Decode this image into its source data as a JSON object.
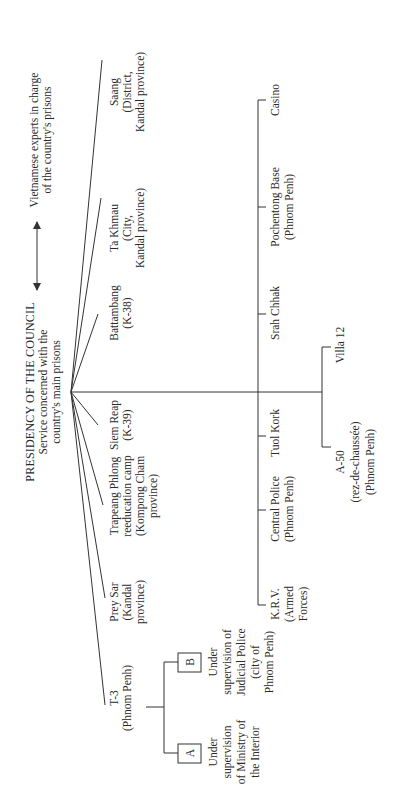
{
  "diagram": {
    "orientation": "rotated-90-counterclockwise",
    "root": {
      "title": "PRESIDENCY OF THE COUNCIL",
      "subtitle_lines": [
        "Service concerned with the",
        "country's main prisons"
      ]
    },
    "side_note": {
      "arrow": "double-headed-arrow",
      "lines": [
        "Vietnamese experts in charge",
        "of the country's prisons"
      ]
    },
    "fan_branches": [
      {
        "id": "saang",
        "lines": [
          "Saang",
          "(District,",
          "Kandal province)"
        ]
      },
      {
        "id": "ta-khmau",
        "lines": [
          "Ta Khmau",
          "(City,",
          "Kandal province)"
        ]
      },
      {
        "id": "battambang",
        "lines": [
          "Battambang",
          "(K-38)"
        ]
      },
      {
        "id": "siem-reap",
        "lines": [
          "Siem Reap",
          "(K-39)"
        ]
      },
      {
        "id": "trapeang-phlong",
        "lines": [
          "Trapeang Phlong",
          "reeducation camp",
          "(Kompong Cham",
          "province)"
        ]
      },
      {
        "id": "prey-sar",
        "lines": [
          "Prey Sar",
          "(Kandal",
          "province)"
        ]
      },
      {
        "id": "t-3",
        "lines": [
          "T-3",
          "(Phnom Penh)"
        ]
      }
    ],
    "t3_sub": [
      {
        "id": "a",
        "box_label": "A",
        "lines": [
          "Under",
          "supervision",
          "of Ministry of",
          "the Interior"
        ]
      },
      {
        "id": "b",
        "box_label": "B",
        "lines": [
          "Under",
          "supervision of",
          "Judicial Police",
          "(city of",
          "Phnom Penh)"
        ]
      }
    ],
    "phnom_penh_branches": [
      {
        "id": "casino",
        "lines": [
          "Casino"
        ]
      },
      {
        "id": "pochentong",
        "lines": [
          "Pochentong Base",
          "(Phnom Penh)"
        ]
      },
      {
        "id": "srah-chhak",
        "lines": [
          "Srah Chhak"
        ]
      },
      {
        "id": "tuol-kork",
        "lines": [
          "Tuol Kork"
        ]
      },
      {
        "id": "central-police",
        "lines": [
          "Central Police",
          "(Phnom Penh)"
        ]
      },
      {
        "id": "krv",
        "lines": [
          "K.R.V.",
          "(Armed",
          "Forces)"
        ]
      }
    ],
    "villa_sub": [
      {
        "id": "villa-12",
        "lines": [
          "Villa 12"
        ]
      },
      {
        "id": "a-50",
        "lines": [
          "A-50",
          "(rez-de-chaussée)",
          "(Phnom Penh)"
        ]
      }
    ]
  },
  "colors": {
    "ink": "#333333",
    "background": "#ffffff"
  }
}
